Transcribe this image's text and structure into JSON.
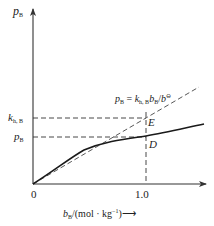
{
  "diagram": {
    "y_axis_label": {
      "main": "p",
      "sub": "B"
    },
    "x_axis_label": {
      "var": "b",
      "sub": "B",
      "units": "/(mol · kg",
      "exp": "−1",
      "close": ")",
      "arrow": "⟶"
    },
    "origin_label": "0",
    "x_tick_label": "1.0",
    "y_tick_labels": [
      {
        "main": "k",
        "sub": "h, B"
      },
      {
        "main": "p",
        "sub": "B"
      }
    ],
    "equation": {
      "lhs": "p",
      "lhs_sub": "B",
      "eq": " = ",
      "k": "k",
      "k_sub": "h, B",
      "b": "b",
      "b_sub": "B",
      "slash": "/",
      "bstd": "b",
      "bstd_sup": "⊖"
    },
    "points": [
      {
        "name": "E",
        "label": "E"
      },
      {
        "name": "D",
        "label": "D"
      }
    ],
    "colors": {
      "line": "#1a1a1a",
      "dashed": "#333333",
      "axis": "#333333",
      "text": "#222222"
    }
  }
}
